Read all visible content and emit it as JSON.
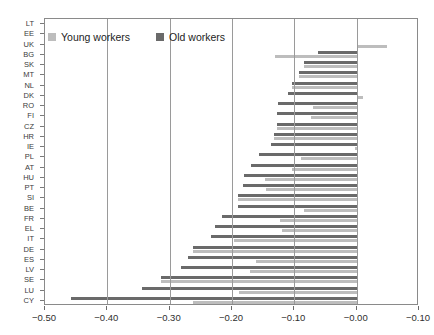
{
  "chart_data": {
    "type": "bar",
    "orientation": "horizontal",
    "title": "",
    "xlabel": "",
    "ylabel": "",
    "xlim": [
      -0.5,
      0.1
    ],
    "xticks": [
      -0.5,
      -0.4,
      -0.3,
      -0.2,
      -0.1,
      -0.0,
      -0.1
    ],
    "xtick_labels": [
      "-0.50",
      "-0.40",
      "-0.30",
      "-0.20",
      "-0.10",
      "-0.00",
      "-0.10"
    ],
    "grid": "vertical",
    "legend_position": "top-left",
    "categories": [
      "LT",
      "EE",
      "UK",
      "BG",
      "SK",
      "MT",
      "NL",
      "DK",
      "RO",
      "FI",
      "CZ",
      "HR",
      "IE",
      "PL",
      "AT",
      "HU",
      "PT",
      "SI",
      "BE",
      "FR",
      "EL",
      "IT",
      "DE",
      "ES",
      "LV",
      "SE",
      "LU",
      "CY"
    ],
    "series": [
      {
        "name": "Old workers",
        "color": "#6a6a6a",
        "values": [
          0.0,
          0.0,
          0.0,
          -0.062,
          -0.085,
          -0.092,
          -0.103,
          -0.11,
          -0.127,
          -0.128,
          -0.128,
          -0.133,
          -0.138,
          -0.156,
          -0.17,
          -0.181,
          -0.182,
          -0.19,
          -0.19,
          -0.216,
          -0.227,
          -0.233,
          -0.262,
          -0.271,
          -0.282,
          -0.314,
          -0.345,
          -0.458
        ]
      },
      {
        "name": "Young workers",
        "color": "#bdbdbd",
        "values": [
          0.0,
          0.0,
          0.049,
          -0.131,
          -0.085,
          -0.092,
          -0.103,
          0.01,
          -0.07,
          -0.073,
          -0.128,
          -0.133,
          -0.003,
          -0.09,
          -0.103,
          -0.147,
          -0.146,
          -0.19,
          -0.085,
          -0.123,
          -0.119,
          -0.196,
          -0.262,
          -0.161,
          -0.171,
          -0.314,
          -0.189,
          -0.262
        ]
      }
    ]
  },
  "legend": {
    "items": [
      {
        "label": "Young workers",
        "swatch": "young-swatch"
      },
      {
        "label": "Old workers",
        "swatch": "old-swatch"
      }
    ]
  },
  "axes": {
    "x_tick_labels": [
      "-0.50",
      "-0.40",
      "-0.30",
      "-0.20",
      "-0.10",
      "-0.00",
      "-0.10"
    ],
    "y_tick_labels": [
      "LT",
      "EE",
      "UK",
      "BG",
      "SK",
      "MT",
      "NL",
      "DK",
      "RO",
      "FI",
      "CZ",
      "HR",
      "IE",
      "PL",
      "AT",
      "HU",
      "PT",
      "SI",
      "BE",
      "FR",
      "EL",
      "IT",
      "DE",
      "ES",
      "LV",
      "SE",
      "LU",
      "CY"
    ]
  },
  "colors": {
    "young": "#bdbdbd",
    "old": "#6a6a6a",
    "grid": "#9a9a9a",
    "frame": "#8a8a8a",
    "text": "#2f2f2f"
  }
}
